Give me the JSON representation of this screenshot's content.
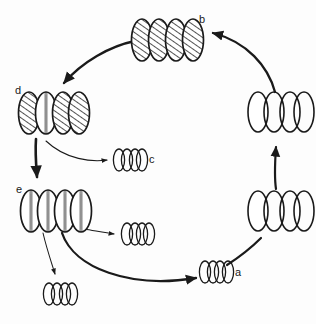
{
  "diagram": {
    "type": "cycle",
    "title": "",
    "background_color": "#fdfdfd",
    "stroke_color": "#1a1a1a",
    "hatch_color": "#1a1a1a",
    "stripe_color": "#8a8a8a",
    "labels": {
      "a": "a",
      "b": "b",
      "c": "c",
      "d": "d",
      "e": "e"
    },
    "states": [
      {
        "id": "b",
        "label": "b",
        "position": "top",
        "unit_count": 4,
        "unit_size": "large",
        "fill_pattern": "diagonal-hatch",
        "patterns": [
          "diagonal-hatch",
          "diagonal-hatch",
          "diagonal-hatch",
          "diagonal-hatch"
        ]
      },
      {
        "id": "d",
        "label": "d",
        "position": "left-upper",
        "unit_count": 4,
        "unit_size": "large",
        "fill_pattern": "mixed",
        "patterns": [
          "diagonal-hatch",
          "vertical-stripe",
          "diagonal-hatch",
          "diagonal-hatch"
        ]
      },
      {
        "id": "e",
        "label": "e",
        "position": "left-lower",
        "unit_count": 4,
        "unit_size": "large",
        "fill_pattern": "vertical-stripe",
        "patterns": [
          "vertical-stripe",
          "vertical-stripe",
          "vertical-stripe",
          "vertical-stripe"
        ]
      },
      {
        "id": "right-lower",
        "label": "",
        "position": "right-lower",
        "unit_count": 4,
        "unit_size": "large",
        "fill_pattern": "empty",
        "patterns": [
          "empty",
          "empty",
          "empty",
          "empty"
        ]
      },
      {
        "id": "right-upper",
        "label": "",
        "position": "right-upper",
        "unit_count": 4,
        "unit_size": "large",
        "fill_pattern": "empty",
        "patterns": [
          "empty",
          "empty",
          "empty",
          "empty"
        ]
      }
    ],
    "products": [
      {
        "id": "c",
        "label": "c",
        "position": "center-upper",
        "unit_count": 4,
        "unit_size": "small",
        "fill_pattern": "empty"
      },
      {
        "id": "product-mid",
        "label": "",
        "position": "center-lower",
        "unit_count": 4,
        "unit_size": "small",
        "fill_pattern": "empty"
      },
      {
        "id": "product-bottom-left",
        "label": "",
        "position": "bottom-left",
        "unit_count": 4,
        "unit_size": "small",
        "fill_pattern": "empty"
      },
      {
        "id": "a",
        "label": "a",
        "position": "bottom-right",
        "unit_count": 4,
        "unit_size": "small",
        "fill_pattern": "empty"
      }
    ],
    "arrows": [
      {
        "id": "arrow-b-to-d",
        "from": "b",
        "to": "d",
        "style": "thick-arc",
        "direction": "counterclockwise"
      },
      {
        "id": "arrow-d-to-e",
        "from": "d",
        "to": "e",
        "style": "thick-straight",
        "direction": "down"
      },
      {
        "id": "arrow-d-to-c",
        "from": "d",
        "to": "c",
        "style": "thin-arc",
        "direction": "right"
      },
      {
        "id": "arrow-e-to-product-mid",
        "from": "e",
        "to": "product-mid",
        "style": "thin-straight",
        "direction": "right"
      },
      {
        "id": "arrow-e-to-product-bottom-left",
        "from": "e",
        "to": "product-bottom-left",
        "style": "thin-straight",
        "direction": "down"
      },
      {
        "id": "arrow-e-to-a",
        "from": "e",
        "to": "a",
        "style": "thick-arc",
        "direction": "counterclockwise"
      },
      {
        "id": "arrow-a-to-right-lower",
        "from": "a",
        "to": "right-lower",
        "style": "thick-arc",
        "direction": "counterclockwise"
      },
      {
        "id": "arrow-right-lower-to-right-upper",
        "from": "right-lower",
        "to": "right-upper",
        "style": "thick-straight",
        "direction": "up"
      },
      {
        "id": "arrow-right-upper-to-b",
        "from": "right-upper",
        "to": "b",
        "style": "thick-arc",
        "direction": "counterclockwise"
      }
    ]
  }
}
